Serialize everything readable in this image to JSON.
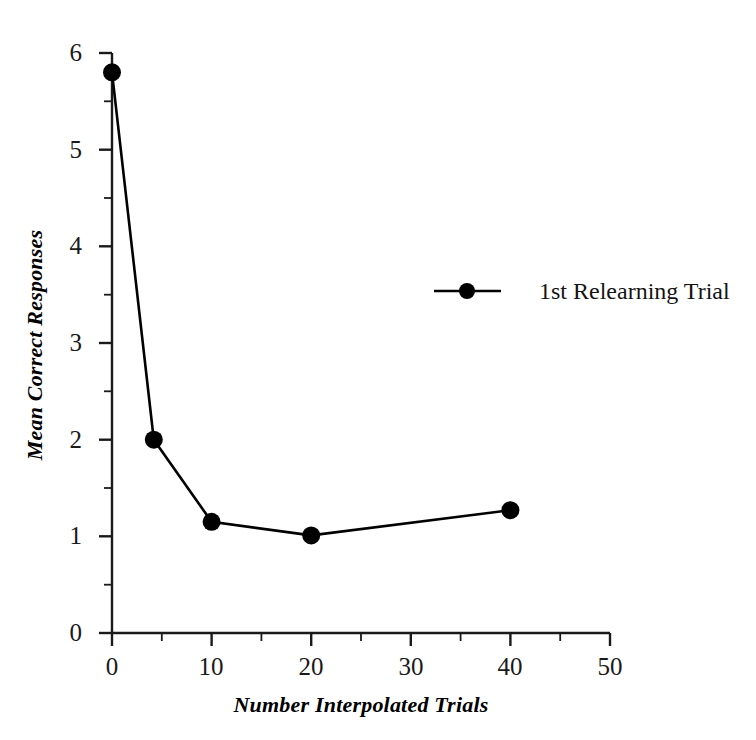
{
  "chart_data": {
    "type": "line",
    "title": "",
    "xlabel": "Number Interpolated Trials",
    "ylabel": "Mean Correct Responses",
    "xlim": [
      0,
      50
    ],
    "ylim": [
      0,
      6
    ],
    "grid": false,
    "legend_position": "upper-right-inside",
    "x_major_ticks": [
      0,
      10,
      20,
      30,
      40,
      50
    ],
    "x_minor_ticks": [
      5,
      15,
      25,
      35,
      45
    ],
    "y_major_ticks": [
      0,
      1,
      2,
      3,
      4,
      5,
      6
    ],
    "y_minor_ticks": [
      0.5,
      1.5,
      2.5,
      3.5,
      4.5,
      5.5
    ],
    "x_tick_labels": [
      "0",
      "10",
      "20",
      "30",
      "40",
      "50"
    ],
    "y_tick_labels": [
      "0",
      "1",
      "2",
      "3",
      "4",
      "5",
      "6"
    ],
    "series": [
      {
        "name": "1st Relearning Trial",
        "marker": "filled-circle",
        "color": "#000000",
        "x": [
          0,
          4.2,
          10,
          20,
          40
        ],
        "values": [
          5.8,
          2.0,
          1.15,
          1.01,
          1.27
        ]
      }
    ]
  },
  "legend": {
    "entries": [
      {
        "label": "1st Relearning Trial",
        "marker_name": "filled-circle-marker"
      }
    ]
  },
  "axes": {
    "x_title": "Number Interpolated Trials",
    "y_title": "Mean Correct Responses"
  },
  "colors": {
    "background": "#ffffff",
    "ink": "#000000",
    "axis": "#1a1a1a",
    "series": "#000000"
  }
}
